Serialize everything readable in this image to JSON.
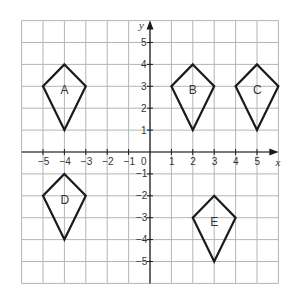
{
  "diagram": {
    "type": "coordinate-grid",
    "x_range": [
      -6,
      6
    ],
    "y_range": [
      -6,
      6
    ],
    "x_axis_label": "x",
    "y_axis_label": "y",
    "origin_label": "0",
    "x_tick_labels": [
      "−5",
      "−4",
      "−3",
      "−2",
      "−1",
      "1",
      "2",
      "3",
      "4",
      "5"
    ],
    "x_tick_values": [
      -5,
      -4,
      -3,
      -2,
      -1,
      1,
      2,
      3,
      4,
      5
    ],
    "y_tick_labels": [
      "5",
      "4",
      "3",
      "2",
      "1",
      "−1",
      "−2",
      "−3",
      "−4",
      "−5"
    ],
    "y_tick_values": [
      5,
      4,
      3,
      2,
      1,
      -1,
      -2,
      -3,
      -4,
      -5
    ],
    "shapes": [
      {
        "label": "A",
        "vertices": [
          [
            -4,
            4
          ],
          [
            -3,
            3
          ],
          [
            -4,
            1
          ],
          [
            -5,
            3
          ]
        ]
      },
      {
        "label": "B",
        "vertices": [
          [
            2,
            4
          ],
          [
            3,
            3
          ],
          [
            2,
            1
          ],
          [
            1,
            3
          ]
        ]
      },
      {
        "label": "C",
        "vertices": [
          [
            5,
            4
          ],
          [
            6,
            3
          ],
          [
            5,
            1
          ],
          [
            4,
            3
          ]
        ]
      },
      {
        "label": "D",
        "vertices": [
          [
            -4,
            -1
          ],
          [
            -3,
            -2
          ],
          [
            -4,
            -4
          ],
          [
            -5,
            -2
          ]
        ]
      },
      {
        "label": "E",
        "vertices": [
          [
            3,
            -2
          ],
          [
            4,
            -3
          ],
          [
            3,
            -5
          ],
          [
            2,
            -3
          ]
        ]
      }
    ],
    "colors": {
      "grid": "#b5b5b5",
      "axis": "#1a1a1a",
      "shape": "#1a1a1a",
      "text": "#333333"
    }
  }
}
